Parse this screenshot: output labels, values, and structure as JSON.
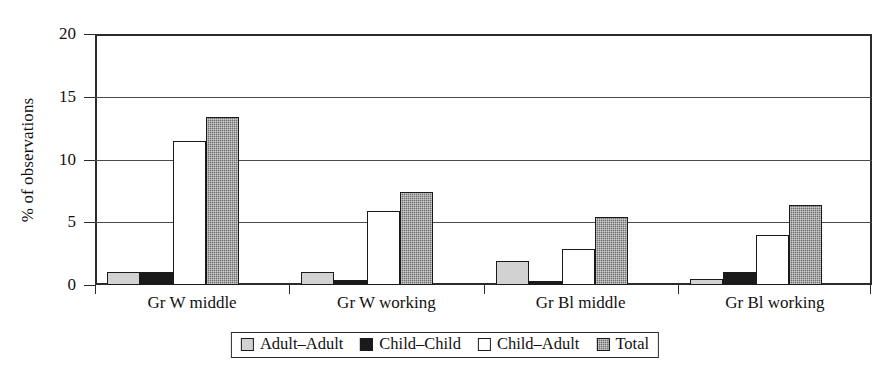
{
  "chart_data": {
    "type": "bar",
    "title": "",
    "xlabel": "",
    "ylabel": "% of observations",
    "ylim": [
      0,
      20
    ],
    "yticks": [
      0,
      5,
      10,
      15,
      20
    ],
    "ytick_labels": [
      "0",
      "5",
      "10",
      "15",
      "20"
    ],
    "grid": true,
    "legend_position": "bottom",
    "categories": [
      "Gr W middle",
      "Gr W working",
      "Gr Bl middle",
      "Gr Bl working"
    ],
    "series": [
      {
        "name": "Adult–Adult",
        "color": "#d2d2d2",
        "values": [
          1.0,
          1.0,
          1.9,
          0.5
        ]
      },
      {
        "name": "Child–Child",
        "color": "#1a1a1a",
        "values": [
          1.0,
          0.4,
          0.3,
          1.05
        ]
      },
      {
        "name": "Child–Adult",
        "color": "#ffffff",
        "values": [
          11.5,
          5.9,
          2.85,
          3.95
        ]
      },
      {
        "name": "Total",
        "color": "#6e6e6e",
        "values": [
          13.4,
          7.4,
          5.45,
          6.35
        ]
      }
    ]
  },
  "axis": {
    "y_title": "% of observations"
  },
  "legend": {
    "items": [
      {
        "label": "Adult–Adult",
        "swatch": "light-gray-square"
      },
      {
        "label": "Child–Child",
        "swatch": "black-square"
      },
      {
        "label": "Child–Adult",
        "swatch": "white-square"
      },
      {
        "label": "Total",
        "swatch": "dark-gray-hatched-square"
      }
    ]
  },
  "colors": {
    "adult_adult": "#d2d2d2",
    "child_child": "#1a1a1a",
    "child_adult": "#ffffff",
    "total": "#6e6e6e",
    "axis": "#2b2b2b",
    "grid": "#4a4a4a",
    "background": "#ffffff"
  }
}
